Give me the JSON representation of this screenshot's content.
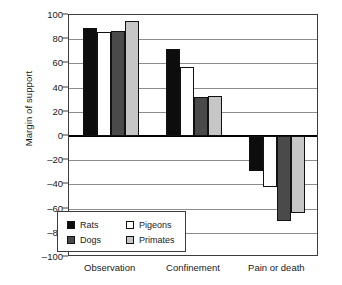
{
  "chart_data": {
    "type": "bar",
    "title": "",
    "xlabel": "",
    "ylabel": "Margin of support",
    "ylim": [
      -100,
      100
    ],
    "yticks": [
      100,
      80,
      60,
      40,
      20,
      0,
      -20,
      -40,
      -60,
      -80,
      -100
    ],
    "ytick_labels": [
      "100",
      "80",
      "60",
      "40",
      "20",
      "0",
      "–20",
      "–40",
      "–60",
      "–80",
      "–100"
    ],
    "grid": true,
    "legend_position": "inside lower-left",
    "categories": [
      "Observation",
      "Confinement",
      "Pain or death"
    ],
    "series": [
      {
        "name": "Rats",
        "color": "#0d0d0d",
        "values": [
          89,
          72,
          -29
        ]
      },
      {
        "name": "Pigeons",
        "color": "#ffffff",
        "values": [
          86,
          57,
          -42
        ]
      },
      {
        "name": "Dogs",
        "color": "#4a4a4a",
        "values": [
          87,
          32,
          -70
        ]
      },
      {
        "name": "Primates",
        "color": "#c6c6c6",
        "values": [
          95,
          33,
          -64
        ]
      }
    ]
  },
  "legend": {
    "entries": [
      {
        "label": "Rats",
        "key": "rats"
      },
      {
        "label": "Pigeons",
        "key": "pigeons"
      },
      {
        "label": "Dogs",
        "key": "dogs"
      },
      {
        "label": "Primates",
        "key": "primates"
      }
    ]
  }
}
